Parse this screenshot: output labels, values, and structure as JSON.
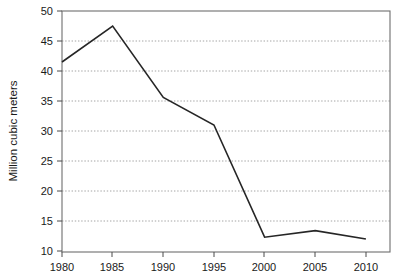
{
  "chart_data": {
    "type": "line",
    "title": "",
    "subtitle": "",
    "xlabel": "",
    "ylabel": "Million cubic meters",
    "x": [
      1980,
      1985,
      1990,
      1995,
      2000,
      2005,
      2010
    ],
    "categories": [
      "1980",
      "1985",
      "1990",
      "1995",
      "2000",
      "2005",
      "2010"
    ],
    "series": [
      {
        "name": "Million cubic meters",
        "values": [
          41.5,
          47.5,
          35.6,
          31.0,
          12.3,
          13.4,
          12.0
        ]
      }
    ],
    "xlim": [
      1978,
      1012
    ],
    "ylim": [
      10,
      50
    ],
    "y_ticks": [
      10,
      15,
      20,
      25,
      30,
      35,
      40,
      45,
      50
    ],
    "y_tick_labels": [
      "10",
      "15",
      "20",
      "25",
      "30",
      "35",
      "40",
      "45",
      "50"
    ],
    "x_ticks": [
      1980,
      1985,
      1990,
      1995,
      2000,
      2005,
      2010
    ],
    "x_tick_labels": [
      "1980",
      "1985",
      "1990",
      "1995",
      "2000",
      "2005",
      "2010"
    ],
    "grid": "horizontal-dotted",
    "legend": "none",
    "line_color": "#262626",
    "grid_color": "#9a9a9a",
    "frame_color": "#6e6e6e",
    "background_color": "#ffffff"
  },
  "axes": {
    "y_title": "Million cubic meters"
  }
}
